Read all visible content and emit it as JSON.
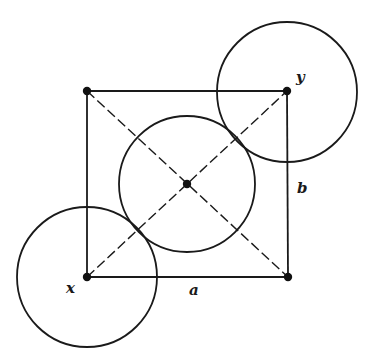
{
  "diagram": {
    "labels": {
      "x": "x",
      "y": "y",
      "a": "a",
      "b": "b"
    },
    "vertices": [
      "top-left",
      "top-right (y)",
      "bottom-right",
      "bottom-left (x)",
      "center"
    ],
    "circles": [
      "circle-at-x",
      "circle-at-y",
      "circle-at-center"
    ],
    "colors": {
      "ink": "#1a1a1a",
      "background": "#ffffff"
    }
  }
}
